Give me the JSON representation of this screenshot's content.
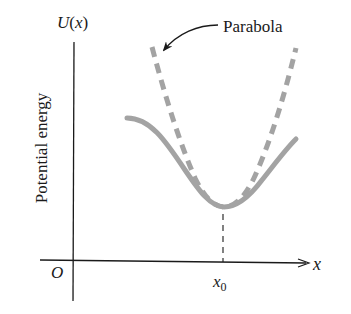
{
  "figure": {
    "y_axis_label": "U(x)",
    "y_axis_label_parts": {
      "fn": "U",
      "open": "(",
      "var": "x",
      "close": ")"
    },
    "y_axis_title": "Potential energy",
    "x_axis_label": "x",
    "origin_label": "O",
    "equilibrium_label": {
      "base": "x",
      "sub": "0"
    },
    "annotation": "Parabola"
  },
  "colors": {
    "axis": "#1a1a1a",
    "curve": "#a3a3a3",
    "parabola": "#a3a3a3",
    "text": "#1a1a1a"
  },
  "curves": {
    "potential": {
      "style": "solid",
      "shape": "asymmetric well",
      "min_x_label": "x0"
    },
    "parabola": {
      "style": "dashed",
      "approximates": "potential near x0"
    }
  }
}
